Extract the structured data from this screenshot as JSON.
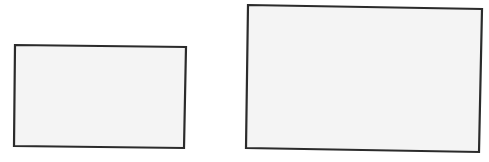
{
  "diagram": {
    "background": "#ffffff",
    "stroke_color": "#2b2b2b",
    "fill_color": "#f4f4f4",
    "shapes": [
      {
        "id": "small-rectangle",
        "type": "rectangle",
        "corners": [
          [
            15,
            45
          ],
          [
            186,
            47
          ],
          [
            184,
            148
          ],
          [
            14,
            146
          ]
        ]
      },
      {
        "id": "large-rectangle",
        "type": "rectangle",
        "corners": [
          [
            248,
            5
          ],
          [
            482,
            9
          ],
          [
            479,
            152
          ],
          [
            246,
            148
          ]
        ]
      }
    ]
  }
}
